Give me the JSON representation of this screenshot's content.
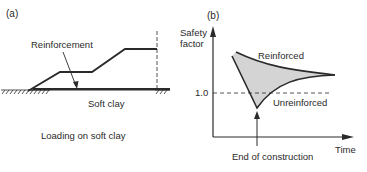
{
  "panel_a": {
    "tag": "(a)",
    "reinforcement_label": "Reinforcement",
    "ground_label": "Soft clay",
    "caption": "Loading on soft clay"
  },
  "panel_b": {
    "tag": "(b)",
    "y_axis_label_line1": "Safety",
    "y_axis_label_line2": "factor",
    "x_axis_label": "Time",
    "reference_tick": "1.0",
    "curve_reinforced": "Reinforced",
    "curve_unreinforced": "Unreinforced",
    "event_label": "End of construction"
  },
  "colors": {
    "ink": "#2a2a2a",
    "shaded_region": "#d4d4d4"
  }
}
